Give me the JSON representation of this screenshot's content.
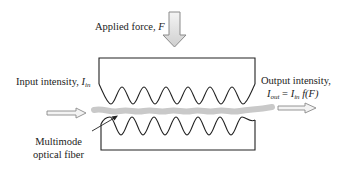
{
  "labels": {
    "applied_force": {
      "text": "Applied force, ",
      "var": "F"
    },
    "input_intensity": {
      "text": "Input intensity, ",
      "var": "I",
      "sub": "in"
    },
    "output_intensity": {
      "text": "Output intensity,",
      "eq_lhs": "I",
      "eq_lhs_sub": "out",
      "eq_mid": " = ",
      "eq_rhs": "I",
      "eq_rhs_sub": "in",
      "eq_fn": " f(F)"
    },
    "fiber": {
      "line1": "Multimode",
      "line2": "optical fiber"
    }
  },
  "colors": {
    "line": "#222222",
    "fiber": "#c8c8c8",
    "arrow_fill": "#e6e6e6",
    "arrow_stroke": "#888888"
  }
}
